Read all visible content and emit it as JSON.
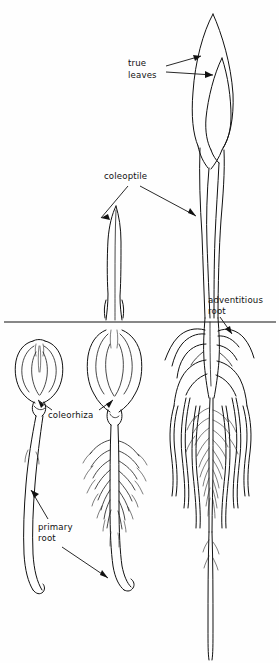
{
  "figure": {
    "background_color": "#fefefe",
    "ink_color": "#111111",
    "width": 279,
    "height": 663
  },
  "soil_line": {
    "name": "soil surface line",
    "y": 322,
    "x_start": 4,
    "x_end": 276
  },
  "labels": [
    {
      "id": "true-leaves",
      "text_line1": "true",
      "text_line2": "leaves",
      "x": 128,
      "y": 62,
      "arrows": 2
    },
    {
      "id": "coleoptile",
      "text_line1": "coleoptile",
      "text_line2": "",
      "x": 104,
      "y": 176,
      "arrows": 2
    },
    {
      "id": "adventitious-root",
      "text_line1": "adventitious",
      "text_line2": "root",
      "x": 208,
      "y": 300,
      "arrows": 1
    },
    {
      "id": "coleorhiza",
      "text_line1": "coleorhiza",
      "text_line2": "",
      "x": 48,
      "y": 415,
      "arrows": 2
    },
    {
      "id": "primary-root",
      "text_line1": "primary",
      "text_line2": "root",
      "x": 38,
      "y": 527,
      "arrows": 2
    }
  ],
  "seedlings": [
    {
      "id": "stage-1",
      "order": 1,
      "name": "earliest stage seedling",
      "parts": [
        "seed grain",
        "coleorhiza",
        "emerging primary root"
      ],
      "center_x": 38
    },
    {
      "id": "stage-2",
      "order": 2,
      "name": "intermediate stage seedling",
      "parts": [
        "coleoptile",
        "seed grain",
        "coleorhiza",
        "primary root",
        "lateral roots"
      ],
      "center_x": 114
    },
    {
      "id": "stage-3",
      "order": 3,
      "name": "advanced stage seedling",
      "parts": [
        "true leaves",
        "coleoptile",
        "adventitious roots",
        "primary root",
        "lateral roots"
      ],
      "center_x": 212
    }
  ]
}
